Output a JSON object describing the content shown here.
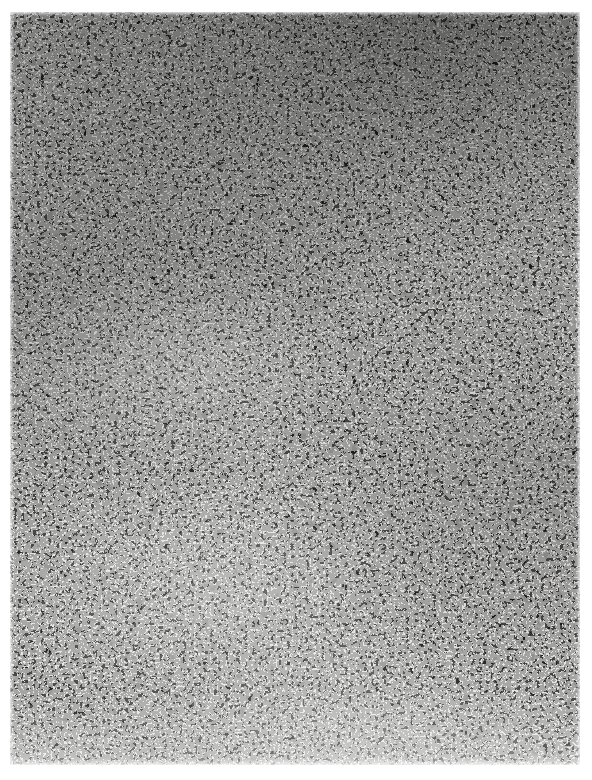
{
  "figure": {
    "kind": "micrograph-plate",
    "title_text": "",
    "caption_text": "",
    "label_text": "",
    "scale_bar_text": "",
    "axis_text": "",
    "legend_text": "",
    "has_visible_text": false,
    "canvas": {
      "width": 592,
      "height": 780,
      "background_hex": "#ffffff"
    },
    "plate": {
      "left": 10,
      "top": 12,
      "width": 570,
      "height": 753,
      "paper_hex": "#f4f3f1",
      "ink_hex": "#141414",
      "mid_ink_hex": "#2b2b2b"
    },
    "margins": {
      "left_px": 10,
      "top_px": 12,
      "right_px": 12,
      "bottom_px": 15
    },
    "texture": {
      "pattern": "binary-thresholded-noise",
      "grain_px": 5,
      "ink_coverage_percent": 52,
      "contrast": "high",
      "notes_density": [
        "denser ink toward top and upper-right",
        "slightly lighter finer grain through lower-centre",
        "faint lightening at the extreme bottom edge"
      ]
    }
  }
}
